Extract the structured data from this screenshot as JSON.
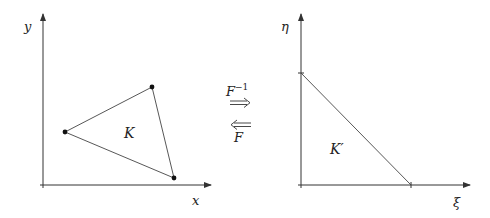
{
  "diagram": {
    "type": "affine reference-element mapping",
    "left_panel": {
      "x_axis_label": "x",
      "y_axis_label": "y",
      "element_label": "K",
      "vertices": [
        [
          65,
          132
        ],
        [
          152,
          87
        ],
        [
          174,
          178
        ]
      ],
      "description": "Physical triangle K in (x, y) coordinates with dotted vertices"
    },
    "right_panel": {
      "x_axis_label": "ξ",
      "y_axis_label": "η",
      "element_label": "K′",
      "description": "Reference right triangle K′ in (ξ, η) coordinates with legs on the axes"
    },
    "mappings": {
      "forward_label": "F⁻¹",
      "forward_base": "F",
      "forward_exponent": "−1",
      "forward_arrow": "⟹",
      "backward_label": "F",
      "backward_arrow": "⟸"
    }
  }
}
